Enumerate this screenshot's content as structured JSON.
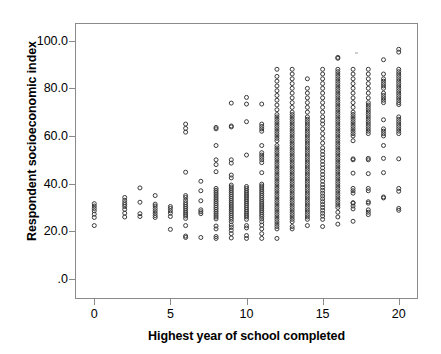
{
  "chart_data": {
    "type": "scatter",
    "title": "",
    "xlabel": "Highest year of school completed",
    "ylabel": "Respondent socioeconomic index",
    "xlim": [
      -1.2,
      21.2
    ],
    "ylim": [
      -8,
      107
    ],
    "xticks": [
      0,
      5,
      10,
      15,
      20
    ],
    "xticklabels": [
      "0",
      "5",
      "10",
      "15",
      "20"
    ],
    "yticks": [
      0,
      20,
      40,
      60,
      80,
      100
    ],
    "yticklabels": [
      ".0",
      "20.0",
      "40.0",
      "60.0",
      "80.0",
      "100.0"
    ],
    "grid": false,
    "legend": null,
    "marker": "open-circle",
    "marker_color": "#3a3a3a",
    "marker_size": 4,
    "frame_color": "#8a8a8a",
    "background": "#ffffff",
    "columns": [
      {
        "x": 0,
        "values": [
          22.4,
          25.8,
          27.2,
          28.6,
          29.6,
          30.6,
          31.6
        ]
      },
      {
        "x": 2,
        "values": [
          26.0,
          27.6,
          29.2,
          30.4,
          31.2,
          32.0,
          33.0,
          34.2
        ]
      },
      {
        "x": 3,
        "values": [
          26.2,
          27.4,
          32.2,
          38.2
        ]
      },
      {
        "x": 4,
        "values": [
          25.8,
          26.6,
          27.6,
          28.6,
          29.6,
          30.6,
          31.4,
          35.0
        ]
      },
      {
        "x": 5,
        "values": [
          20.8,
          26.2,
          27.6,
          28.6,
          29.6,
          30.4
        ]
      },
      {
        "x": 6,
        "values": [
          17.4,
          18.0,
          22.4,
          25.4,
          26.4,
          27.2,
          28.0,
          28.8,
          29.6,
          30.4,
          31.2,
          32.0,
          33.0,
          34.2,
          35.0,
          44.8,
          61.6,
          63.2,
          65.0
        ]
      },
      {
        "x": 7,
        "values": [
          17.4,
          27.4,
          28.2,
          29.0,
          32.8,
          37.0,
          41.0
        ]
      },
      {
        "x": 8,
        "values": [
          17.0,
          17.8,
          21.0,
          22.2,
          25.2,
          26.0,
          26.8,
          27.6,
          28.4,
          29.2,
          30.0,
          30.8,
          31.6,
          32.4,
          33.2,
          34.0,
          34.8,
          35.6,
          36.4,
          37.2,
          38.0,
          45.0,
          48.0,
          50.0,
          56.0,
          63.0,
          63.6
        ]
      },
      {
        "x": 9,
        "values": [
          17.2,
          19.0,
          20.4,
          21.6,
          22.6,
          24.0,
          25.0,
          25.8,
          26.6,
          27.4,
          28.2,
          29.0,
          29.8,
          30.6,
          31.4,
          32.2,
          33.0,
          33.8,
          34.6,
          35.4,
          36.2,
          37.0,
          37.8,
          38.6,
          39.4,
          42.4,
          43.6,
          48.6,
          50.0,
          63.8,
          64.2,
          73.8
        ]
      },
      {
        "x": 10,
        "values": [
          17.0,
          18.2,
          21.4,
          22.4,
          25.0,
          26.0,
          26.8,
          27.6,
          28.4,
          29.2,
          30.0,
          30.8,
          31.6,
          32.4,
          33.2,
          34.0,
          34.8,
          35.6,
          36.4,
          37.2,
          38.0,
          38.8,
          52.0,
          66.0,
          73.4,
          76.2
        ]
      },
      {
        "x": 11,
        "values": [
          17.0,
          19.0,
          21.0,
          22.6,
          24.0,
          25.2,
          26.2,
          27.0,
          27.8,
          28.6,
          29.4,
          30.2,
          31.0,
          31.8,
          32.6,
          33.4,
          34.2,
          35.0,
          35.8,
          36.6,
          37.4,
          38.2,
          39.0,
          39.8,
          44.6,
          48.8,
          50.0,
          51.0,
          52.0,
          53.0,
          56.0,
          62.0,
          63.0,
          64.0,
          65.0,
          73.4
        ]
      },
      {
        "x": 12,
        "values": [
          17.0,
          21.0,
          22.0,
          23.0,
          24.0,
          25.0,
          26.0,
          27.0,
          28.0,
          29.0,
          30.0,
          31.0,
          32.0,
          33.0,
          34.0,
          35.0,
          36.0,
          37.0,
          38.0,
          39.0,
          40.0,
          41.0,
          42.0,
          43.0,
          44.0,
          45.0,
          46.0,
          47.0,
          48.0,
          49.0,
          50.0,
          51.0,
          52.0,
          53.0,
          54.0,
          55.0,
          56.0,
          58.0,
          59.0,
          60.0,
          61.0,
          62.0,
          63.0,
          64.0,
          65.0,
          66.0,
          67.0,
          68.0,
          69.0,
          71.0,
          73.0,
          75.0,
          77.0,
          79.0,
          81.0,
          83.0,
          85.0,
          88.0
        ]
      },
      {
        "x": 13,
        "values": [
          21.0,
          22.0,
          24.0,
          25.0,
          26.0,
          27.0,
          28.0,
          29.0,
          30.0,
          31.0,
          32.0,
          33.0,
          34.0,
          35.0,
          36.0,
          37.0,
          38.0,
          39.0,
          40.0,
          41.0,
          42.0,
          43.0,
          44.0,
          45.0,
          46.0,
          47.0,
          48.0,
          49.0,
          50.0,
          51.0,
          52.0,
          53.0,
          54.0,
          55.0,
          56.0,
          57.0,
          58.0,
          59.0,
          60.0,
          61.0,
          62.0,
          63.0,
          64.0,
          65.0,
          66.0,
          67.0,
          68.0,
          69.0,
          70.0,
          72.0,
          74.0,
          76.0,
          78.0,
          80.0,
          82.0,
          84.0,
          86.0,
          88.0
        ]
      },
      {
        "x": 14,
        "values": [
          22.4,
          25.0,
          26.0,
          27.0,
          28.0,
          29.0,
          30.0,
          31.0,
          32.0,
          33.0,
          34.0,
          35.0,
          36.0,
          37.0,
          38.0,
          39.0,
          40.0,
          41.0,
          42.0,
          43.0,
          44.0,
          45.0,
          46.0,
          47.0,
          48.0,
          49.0,
          50.0,
          51.0,
          52.0,
          53.0,
          54.0,
          55.0,
          56.0,
          57.0,
          58.0,
          59.0,
          60.0,
          61.0,
          62.0,
          63.0,
          64.0,
          65.0,
          66.0,
          67.0,
          68.0,
          70.0,
          72.0,
          74.0,
          76.0,
          78.0,
          80.0,
          84.0
        ]
      },
      {
        "x": 15,
        "values": [
          22.0,
          25.0,
          26.4,
          27.6,
          28.8,
          30.0,
          31.2,
          32.4,
          33.6,
          34.8,
          36.0,
          37.2,
          38.4,
          39.6,
          41.0,
          42.4,
          43.8,
          45.2,
          46.6,
          48.0,
          49.4,
          50.8,
          52.2,
          53.6,
          55.0,
          57.0,
          59.0,
          61.0,
          63.0,
          65.0,
          66.4,
          68.0,
          70.0,
          72.0,
          74.0,
          76.0,
          78.0,
          80.0,
          82.0,
          84.0,
          86.0,
          88.0
        ]
      },
      {
        "x": 16,
        "values": [
          23.0,
          26.0,
          28.0,
          30.0,
          31.0,
          32.0,
          33.0,
          34.0,
          35.0,
          36.0,
          37.0,
          38.0,
          39.0,
          40.0,
          41.0,
          42.0,
          43.0,
          44.0,
          45.0,
          46.0,
          47.0,
          48.0,
          49.0,
          50.0,
          51.0,
          52.0,
          53.0,
          54.0,
          55.0,
          56.0,
          57.0,
          58.0,
          59.0,
          60.0,
          61.0,
          62.0,
          63.0,
          64.0,
          65.0,
          66.0,
          67.0,
          68.0,
          69.0,
          70.0,
          71.0,
          72.0,
          73.0,
          74.0,
          75.0,
          76.0,
          77.0,
          78.0,
          79.0,
          80.0,
          81.0,
          82.0,
          83.0,
          84.0,
          85.0,
          86.0,
          87.0,
          88.0,
          92.6,
          93.0
        ]
      },
      {
        "x": 17,
        "values": [
          24.2,
          29.4,
          30.6,
          31.8,
          32.0,
          36.0,
          37.0,
          38.0,
          44.4,
          50.0,
          50.4,
          58.0,
          60.0,
          61.0,
          62.0,
          63.0,
          64.0,
          65.0,
          66.0,
          67.0,
          68.0,
          69.0,
          70.0,
          72.0,
          74.0,
          76.0,
          78.0,
          80.0,
          82.0,
          84.0,
          86.0,
          88.0
        ]
      },
      {
        "x": 18,
        "values": [
          27.0,
          28.0,
          29.0,
          31.8,
          32.4,
          37.0,
          38.0,
          44.2,
          50.0,
          50.6,
          61.0,
          62.0,
          63.0,
          64.0,
          65.0,
          66.0,
          67.0,
          68.0,
          69.0,
          70.0,
          71.0,
          72.0,
          73.0,
          74.0,
          76.0,
          78.0,
          80.0,
          82.0,
          84.0,
          86.0,
          88.0
        ]
      },
      {
        "x": 19,
        "values": [
          34.0,
          34.4,
          44.6,
          50.6,
          56.0,
          60.0,
          61.0,
          62.0,
          63.0,
          66.8,
          74.0,
          75.0,
          76.0,
          77.0,
          78.0,
          80.0,
          81.0,
          82.0,
          83.0,
          84.0,
          86.0,
          92.0
        ]
      },
      {
        "x": 20,
        "values": [
          28.8,
          29.6,
          36.8,
          38.0,
          50.4,
          61.0,
          62.0,
          63.0,
          64.0,
          65.0,
          66.0,
          67.0,
          68.0,
          73.2,
          74.0,
          75.0,
          76.0,
          77.0,
          78.0,
          79.0,
          80.0,
          81.0,
          82.0,
          83.0,
          84.0,
          85.0,
          86.0,
          87.0,
          88.0,
          95.2,
          96.4
        ]
      }
    ]
  }
}
